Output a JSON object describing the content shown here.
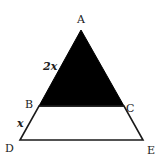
{
  "figure": {
    "type": "triangle-similarity-diagram",
    "points": {
      "A": {
        "label": "A",
        "x": 81,
        "y": 30
      },
      "B": {
        "label": "B",
        "x": 39,
        "y": 106
      },
      "C": {
        "label": "C",
        "x": 124,
        "y": 106
      },
      "D": {
        "label": "D",
        "x": 20,
        "y": 140
      },
      "E": {
        "label": "E",
        "x": 143,
        "y": 140
      }
    },
    "segment_labels": {
      "AB": "2x",
      "BD": "x"
    },
    "shaded_region": "triangle ABC",
    "colors": {
      "shaded": "#000000",
      "stroke": "#1a1a1a",
      "background": "#ffffff"
    }
  }
}
